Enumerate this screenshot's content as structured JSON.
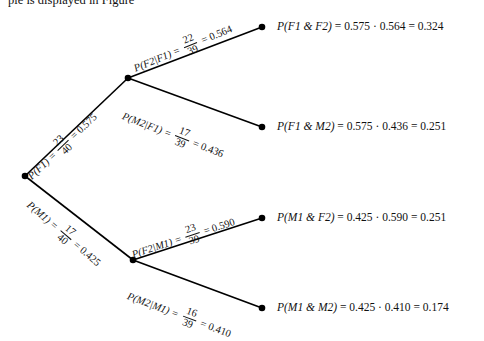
{
  "figure": {
    "type": "probability-tree-diagram",
    "cropped_caption_top": "ple is displayed in Figure",
    "ink_color": "#000000"
  },
  "nodes": [
    {
      "id": "root",
      "x": 25,
      "y": 176,
      "label": ""
    },
    {
      "id": "f1",
      "x": 128,
      "y": 78,
      "label": ""
    },
    {
      "id": "m1",
      "x": 133,
      "y": 260,
      "label": ""
    },
    {
      "id": "leaf1",
      "x": 262,
      "y": 27,
      "label": ""
    },
    {
      "id": "leaf2",
      "x": 262,
      "y": 127,
      "label": ""
    },
    {
      "id": "leaf3",
      "x": 262,
      "y": 218,
      "label": ""
    },
    {
      "id": "leaf4",
      "x": 262,
      "y": 308,
      "label": ""
    }
  ],
  "branches": [
    {
      "id": "p-f1",
      "from": "root",
      "to": "f1",
      "event": "P(F1)",
      "numerator": "23",
      "denominator": "40",
      "value": "0.575",
      "label_x": 29,
      "label_y": 166,
      "angle": -43.5
    },
    {
      "id": "p-m1",
      "from": "root",
      "to": "m1",
      "event": "P(M1)",
      "numerator": "17",
      "denominator": "40",
      "value": "0.425",
      "label_x": 29,
      "label_y": 192,
      "angle": 40.5
    },
    {
      "id": "p-f2-given-f1",
      "from": "f1",
      "to": "leaf1",
      "event": "P(F2|F1)",
      "numerator": "22",
      "denominator": "39",
      "value": "0.564",
      "label_x": 134,
      "label_y": 57,
      "angle": -22.5
    },
    {
      "id": "p-m2-given-f1",
      "from": "f1",
      "to": "leaf2",
      "event": "P(M2|F1)",
      "numerator": "17",
      "denominator": "39",
      "value": "0.436",
      "label_x": 123,
      "label_y": 104,
      "angle": 21.0
    },
    {
      "id": "p-f2-given-m1",
      "from": "m1",
      "to": "leaf3",
      "event": "P(F2|M1)",
      "numerator": "23",
      "denominator": "39",
      "value": "0.590",
      "label_x": 132,
      "label_y": 243,
      "angle": -18.0
    },
    {
      "id": "p-m2-given-m1",
      "from": "m1",
      "to": "leaf4",
      "event": "P(M2|M1)",
      "numerator": "16",
      "denominator": "39",
      "value": "0.410",
      "label_x": 128,
      "label_y": 284,
      "angle": 20.5
    }
  ],
  "results": [
    {
      "id": "res-f1-f2",
      "node": "leaf1",
      "event": "P(F1 & F2)",
      "factor1": "0.575",
      "factor2": "0.564",
      "product": "0.324",
      "x": 277,
      "y": 20
    },
    {
      "id": "res-f1-m2",
      "node": "leaf2",
      "event": "P(F1 & M2)",
      "factor1": "0.575",
      "factor2": "0.436",
      "product": "0.251",
      "x": 277,
      "y": 120
    },
    {
      "id": "res-m1-f2",
      "node": "leaf3",
      "event": "P(M1 & F2)",
      "factor1": "0.425",
      "factor2": "0.590",
      "product": "0.251",
      "x": 277,
      "y": 211
    },
    {
      "id": "res-m1-m2",
      "node": "leaf4",
      "event": "P(M1 & M2)",
      "factor1": "0.425",
      "factor2": "0.410",
      "product": "0.174",
      "x": 277,
      "y": 301
    }
  ],
  "chart_data": {
    "type": "diagram",
    "title": "",
    "stage1": [
      {
        "outcome": "F1",
        "fraction": "23/40",
        "probability": 0.575
      },
      {
        "outcome": "M1",
        "fraction": "17/40",
        "probability": 0.425
      }
    ],
    "stage2": [
      {
        "given": "F1",
        "outcome": "F2",
        "fraction": "22/39",
        "probability": 0.564
      },
      {
        "given": "F1",
        "outcome": "M2",
        "fraction": "17/39",
        "probability": 0.436
      },
      {
        "given": "M1",
        "outcome": "F2",
        "fraction": "23/39",
        "probability": 0.59
      },
      {
        "given": "M1",
        "outcome": "M2",
        "fraction": "16/39",
        "probability": 0.41
      }
    ],
    "joint": [
      {
        "outcome": "F1 & F2",
        "probability": 0.324
      },
      {
        "outcome": "F1 & M2",
        "probability": 0.251
      },
      {
        "outcome": "M1 & F2",
        "probability": 0.251
      },
      {
        "outcome": "M1 & M2",
        "probability": 0.174
      }
    ]
  }
}
